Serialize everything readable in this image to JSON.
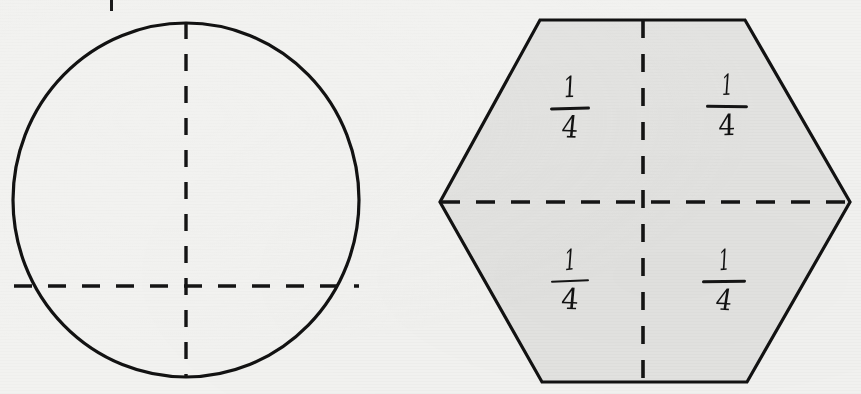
{
  "page": {
    "width": 861,
    "height": 394,
    "background_color": "#f2f2f0",
    "ink_color": "#121212"
  },
  "figures": [
    {
      "id": "circle-figure",
      "name": "circle",
      "shape": "circle",
      "filled": false,
      "fill_color": "none",
      "outline_color": "#121212",
      "center": {
        "x": 186,
        "y": 200
      },
      "radius_x": 174,
      "radius_y": 178,
      "partitions": {
        "style": "dashed",
        "count": 2,
        "lines": [
          {
            "orientation": "vertical",
            "x": 186,
            "from_y": 22,
            "to_y": 378
          },
          {
            "orientation": "horizontal",
            "y": 286,
            "from_x": 13,
            "to_x": 360
          }
        ]
      },
      "labels": []
    },
    {
      "id": "hexagon-figure",
      "name": "hexagon",
      "shape": "hexagon",
      "filled": true,
      "fill_color": "#e3e3e1",
      "outline_color": "#121212",
      "vertices": [
        {
          "x": 540,
          "y": 20
        },
        {
          "x": 745,
          "y": 20
        },
        {
          "x": 850,
          "y": 202
        },
        {
          "x": 747,
          "y": 382
        },
        {
          "x": 542,
          "y": 382
        },
        {
          "x": 440,
          "y": 202
        }
      ],
      "partitions": {
        "style": "dashed",
        "count": 2,
        "lines": [
          {
            "orientation": "vertical",
            "x": 643,
            "from_y": 20,
            "to_y": 382
          },
          {
            "orientation": "horizontal",
            "y": 202,
            "from_x": 440,
            "to_x": 850
          }
        ]
      },
      "labels": [
        {
          "id": "hex-label-top-left",
          "text_numerator": "1",
          "text_denominator": "4",
          "text": "1/4",
          "quadrant": "top-left",
          "x": 543,
          "y": 74
        },
        {
          "id": "hex-label-top-right",
          "text_numerator": "1",
          "text_denominator": "4",
          "text": "1/4",
          "quadrant": "top-right",
          "x": 700,
          "y": 72
        },
        {
          "id": "hex-label-bottom-left",
          "text_numerator": "1",
          "text_denominator": "4",
          "text": "1/4",
          "quadrant": "bottom-left",
          "x": 543,
          "y": 247
        },
        {
          "id": "hex-label-bottom-right",
          "text_numerator": "1",
          "text_denominator": "4",
          "text": "1/4",
          "quadrant": "bottom-right",
          "x": 697,
          "y": 247
        }
      ]
    }
  ],
  "stray_marks": [
    {
      "id": "top-stray-tick",
      "x": 110,
      "y": 0,
      "width": 3,
      "height": 11
    }
  ]
}
